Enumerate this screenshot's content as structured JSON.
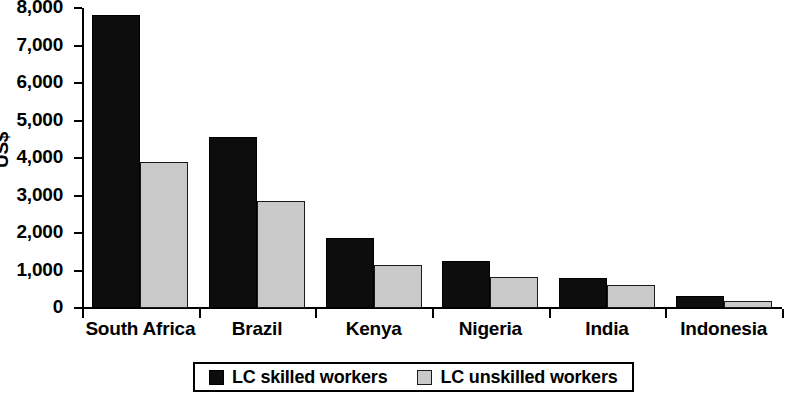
{
  "chart_data": {
    "type": "bar",
    "title": "",
    "subtitle": "",
    "xlabel": "",
    "ylabel": "US$",
    "ylim": [
      0,
      8000
    ],
    "ytick_labels": [
      "8,000",
      "7,000",
      "6,000",
      "5,000",
      "4,000",
      "3,000",
      "2,000",
      "1,000",
      "0"
    ],
    "ytick_values": [
      8000,
      7000,
      6000,
      5000,
      4000,
      3000,
      2000,
      1000,
      0
    ],
    "ytick_step": 1000,
    "grid": false,
    "legend_position": "bottom",
    "categories": [
      "South Africa",
      "Brazil",
      "Kenya",
      "Nigeria",
      "India",
      "Indonesia"
    ],
    "series": [
      {
        "name": "LC skilled workers",
        "color": "#0d0d0d",
        "values": [
          7820,
          4550,
          1880,
          1250,
          810,
          330
        ]
      },
      {
        "name": "LC unskilled workers",
        "color": "#c9c9c9",
        "values": [
          3900,
          2850,
          1160,
          820,
          620,
          200
        ]
      }
    ]
  },
  "legend": {
    "entries": [
      {
        "label": "LC skilled workers",
        "swatch": "black-square-icon"
      },
      {
        "label": "LC unskilled workers",
        "swatch": "gray-square-icon"
      }
    ]
  }
}
